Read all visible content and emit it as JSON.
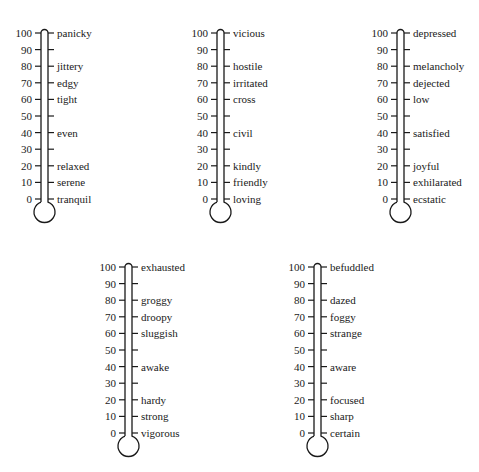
{
  "thermometers": [
    {
      "id": "anxiety",
      "position": {
        "left": 8,
        "top": 27
      },
      "scale": [
        "100",
        "90",
        "80",
        "70",
        "60",
        "50",
        "40",
        "30",
        "20",
        "10",
        "0"
      ],
      "labels": [
        "panicky",
        "",
        "jittery",
        "edgy",
        "tight",
        "",
        "even",
        "",
        "relaxed",
        "serene",
        "tranquil"
      ]
    },
    {
      "id": "anger",
      "position": {
        "left": 184,
        "top": 27
      },
      "scale": [
        "100",
        "90",
        "80",
        "70",
        "60",
        "50",
        "40",
        "30",
        "20",
        "10",
        "0"
      ],
      "labels": [
        "vicious",
        "",
        "hostile",
        "irritated",
        "cross",
        "",
        "civil",
        "",
        "kindly",
        "friendly",
        "loving"
      ]
    },
    {
      "id": "depression",
      "position": {
        "left": 364,
        "top": 27
      },
      "scale": [
        "100",
        "90",
        "80",
        "70",
        "60",
        "50",
        "40",
        "30",
        "20",
        "10",
        "0"
      ],
      "labels": [
        "depressed",
        "",
        "melancholy",
        "dejected",
        "low",
        "",
        "satisfied",
        "",
        "joyful",
        "exhilarated",
        "ecstatic"
      ]
    },
    {
      "id": "fatigue",
      "position": {
        "left": 92,
        "top": 261
      },
      "scale": [
        "100",
        "90",
        "80",
        "70",
        "60",
        "50",
        "40",
        "30",
        "20",
        "10",
        "0"
      ],
      "labels": [
        "exhausted",
        "",
        "groggy",
        "droopy",
        "sluggish",
        "",
        "awake",
        "",
        "hardy",
        "strong",
        "vigorous"
      ]
    },
    {
      "id": "confusion",
      "position": {
        "left": 281,
        "top": 261
      },
      "scale": [
        "100",
        "90",
        "80",
        "70",
        "60",
        "50",
        "40",
        "30",
        "20",
        "10",
        "0"
      ],
      "labels": [
        "befuddled",
        "",
        "dazed",
        "foggy",
        "strange",
        "",
        "aware",
        "",
        "focused",
        "sharp",
        "certain"
      ]
    }
  ],
  "colors": {
    "stroke": "#1a1a1a",
    "background": "#ffffff"
  }
}
